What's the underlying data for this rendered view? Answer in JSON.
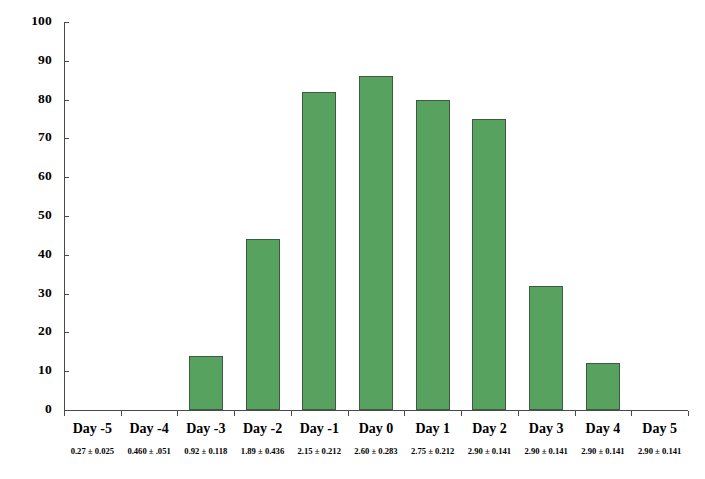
{
  "chart_data": {
    "type": "bar",
    "title": "",
    "subtitle": "",
    "xlabel": "",
    "ylabel": "",
    "ylim": [
      0,
      100
    ],
    "ytick_step": 10,
    "yticks": [
      100,
      90,
      80,
      70,
      60,
      50,
      40,
      30,
      20,
      10,
      0
    ],
    "grid": false,
    "legend": "none",
    "bar_color": "#57a25f",
    "bar_border_color": "#3f5a42",
    "axis_color": "#4a4a4a",
    "categories": [
      "Day -5",
      "Day -4",
      "Day -3",
      "Day -2",
      "Day -1",
      "Day 0",
      "Day 1",
      "Day 2",
      "Day 3",
      "Day 4",
      "Day 5"
    ],
    "values": [
      0,
      0,
      14,
      44,
      82,
      86,
      80,
      75,
      32,
      12,
      0
    ],
    "annotations": [
      "0.27 ± 0.025",
      "0.460 ± .051",
      "0.92 ± 0.118",
      "1.89 ± 0.436",
      "2.15 ± 0.212",
      "2.60 ± 0.283",
      "2.75 ± 0.212",
      "2.90 ± 0.141",
      "2.90 ± 0.141",
      "2.90 ± 0.141",
      "2.90 ± 0.141"
    ]
  }
}
